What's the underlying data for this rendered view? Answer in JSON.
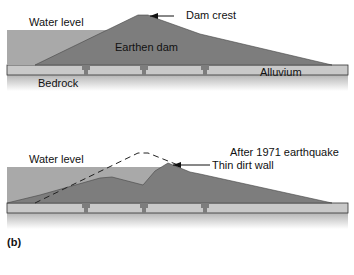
{
  "panel_top": {
    "labels": {
      "water_level": "Water level",
      "earthen_dam": "Earthen dam",
      "dam_crest": "Dam crest",
      "alluvium": "Alluvium",
      "bedrock": "Bedrock"
    }
  },
  "panel_bottom": {
    "labels": {
      "caption": "After 1971 earthquake",
      "water_level": "Water level",
      "thin_dirt_wall": "Thin dirt wall",
      "panel_id": "(b)"
    }
  },
  "colors": {
    "water": "#a9a9a9",
    "dam": "#7d7d7d",
    "alluvium": "#c9c9c9",
    "bedrock_top": "#bdbdbd",
    "outline": "#333333"
  }
}
